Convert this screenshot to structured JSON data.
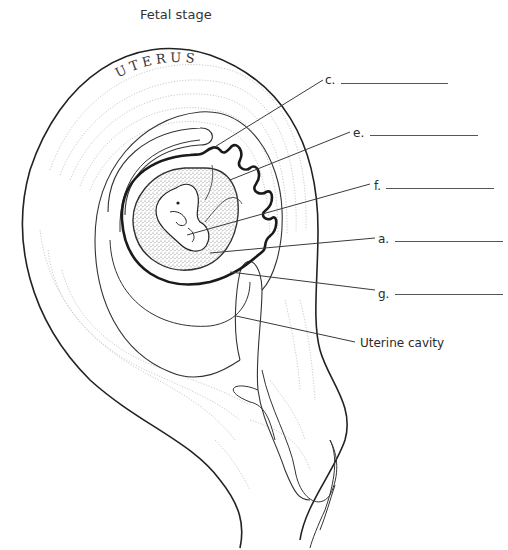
{
  "title": "Fetal stage",
  "organ_label": "UTERUS",
  "labels": [
    {
      "id": "c",
      "text": "c.",
      "x": 325,
      "y": 73,
      "blank_x": 341,
      "blank_w": 107,
      "blank_y": 83,
      "leader": [
        [
          213,
          148
        ],
        [
          323,
          80
        ]
      ]
    },
    {
      "id": "e",
      "text": "e.",
      "x": 353,
      "y": 126,
      "blank_x": 370,
      "blank_w": 108,
      "blank_y": 135,
      "leader": [
        [
          230,
          180
        ],
        [
          350,
          132
        ]
      ]
    },
    {
      "id": "f",
      "text": "f.",
      "x": 374,
      "y": 179,
      "blank_x": 386,
      "blank_w": 108,
      "blank_y": 188,
      "leader": [
        [
          187,
          235
        ],
        [
          370,
          184
        ]
      ]
    },
    {
      "id": "a",
      "text": "a.",
      "x": 378,
      "y": 232,
      "blank_x": 395,
      "blank_w": 108,
      "blank_y": 241,
      "leader": [
        [
          210,
          253
        ],
        [
          375,
          238
        ]
      ]
    },
    {
      "id": "g",
      "text": "g.",
      "x": 378,
      "y": 287,
      "blank_x": 395,
      "blank_w": 108,
      "blank_y": 294,
      "leader": [
        [
          230,
          272
        ],
        [
          375,
          290
        ]
      ]
    }
  ],
  "cavity_label": {
    "text": "Uterine cavity",
    "x": 360,
    "y": 336,
    "leader": [
      [
        236,
        316
      ],
      [
        355,
        342
      ]
    ]
  },
  "colors": {
    "line": "#2b2b2b",
    "stipple": "#9a9a9a",
    "texture": "#c4c4c4"
  }
}
